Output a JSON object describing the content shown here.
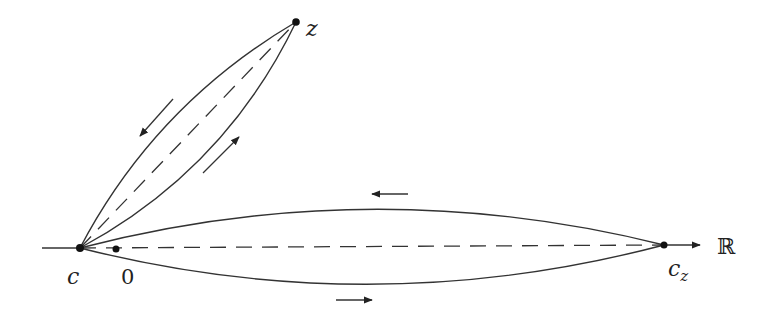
{
  "diagram": {
    "type": "contour-diagram",
    "colors": {
      "stroke": "#333333",
      "background": "#ffffff"
    },
    "points": {
      "c": {
        "label": "c",
        "x": 80,
        "y": 248
      },
      "zero": {
        "label": "0",
        "x": 116,
        "y": 249
      },
      "cz": {
        "label": "c",
        "label_sub": "z",
        "x": 664,
        "y": 245
      },
      "z": {
        "label": "z",
        "x": 296,
        "y": 22
      }
    },
    "axis": {
      "label": "ℝ",
      "x_start": 42,
      "x_end": 700,
      "y": 247
    },
    "contours": [
      {
        "name": "real-lens-upper",
        "direction": "leftward"
      },
      {
        "name": "real-lens-lower",
        "direction": "rightward"
      },
      {
        "name": "z-lens-left",
        "direction": "toward c"
      },
      {
        "name": "z-lens-right",
        "direction": "toward z"
      }
    ],
    "arrows": [
      {
        "name": "upper-arrow",
        "direction": "left"
      },
      {
        "name": "lower-arrow",
        "direction": "right"
      },
      {
        "name": "z-left-arrow",
        "direction": "down-left"
      },
      {
        "name": "z-right-arrow",
        "direction": "up-right"
      }
    ]
  }
}
